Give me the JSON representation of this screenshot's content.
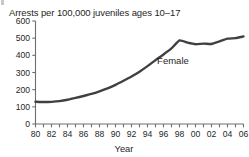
{
  "chart_data": {
    "type": "line",
    "title": "Arrests per 100,000 juveniles ages 10–17",
    "xlabel": "Year",
    "ylabel": "",
    "xlim": [
      1980,
      2006
    ],
    "ylim": [
      0,
      600
    ],
    "grid": false,
    "legend_position": "inline-annotation",
    "y_ticks": [
      0,
      100,
      200,
      300,
      400,
      500,
      600
    ],
    "y_tick_labels": [
      "0",
      "100",
      "200",
      "300",
      "400",
      "500",
      "600"
    ],
    "x_ticks": [
      1980,
      1982,
      1984,
      1986,
      1988,
      1990,
      1992,
      1994,
      1996,
      1998,
      2000,
      2002,
      2004,
      2006
    ],
    "x_tick_labels": [
      "80",
      "82",
      "84",
      "86",
      "88",
      "90",
      "92",
      "94",
      "96",
      "98",
      "00",
      "02",
      "04",
      "06"
    ],
    "x_minor_tick_interval": 1,
    "line_color": "#404040",
    "line_width": 2.4,
    "annotations": [
      {
        "text": "Female",
        "x": 1995.2,
        "y": 352
      }
    ],
    "series": [
      {
        "name": "Female",
        "x": [
          1980,
          1981,
          1982,
          1983,
          1984,
          1985,
          1986,
          1987,
          1988,
          1989,
          1990,
          1991,
          1992,
          1993,
          1994,
          1995,
          1996,
          1997,
          1998,
          1999,
          2000,
          2001,
          2002,
          2003,
          2004,
          2005,
          2006
        ],
        "values": [
          130,
          128,
          129,
          133,
          141,
          152,
          163,
          175,
          190,
          207,
          228,
          252,
          277,
          305,
          337,
          372,
          405,
          440,
          487,
          474,
          465,
          468,
          466,
          481,
          497,
          500,
          510
        ]
      }
    ]
  }
}
